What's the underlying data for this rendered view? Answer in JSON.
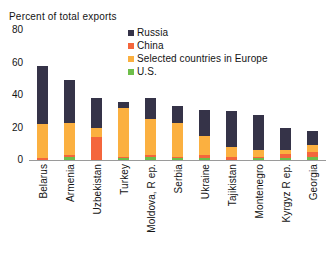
{
  "chart_data": {
    "type": "bar",
    "subtype": "stacked-vertical",
    "title": "Percent of total exports",
    "xlabel": "",
    "ylabel": "",
    "ylim": [
      0,
      80
    ],
    "yticks": [
      80,
      60,
      40,
      20,
      0
    ],
    "grid": false,
    "legend_position": "top-right",
    "stack_order_bottom_to_top": [
      "U.S.",
      "China",
      "Selected countries in Europe",
      "Russia"
    ],
    "categories": [
      "Belarus",
      "Armenia",
      "Uzbekistan",
      "Turkey",
      "Moldova, R ep.",
      "Serbia",
      "Ukraine",
      "Tajikistan",
      "Montenegro",
      "Kyrgyz R ep.",
      "Georgia"
    ],
    "series": [
      {
        "name": "U.S.",
        "color": "#6EBE4A",
        "values": [
          0,
          2,
          0,
          1,
          2,
          1,
          1,
          0,
          1,
          1,
          2
        ]
      },
      {
        "name": "China",
        "color": "#F4663C",
        "values": [
          1,
          1,
          14,
          1,
          1,
          1,
          2,
          2,
          1,
          3,
          3
        ]
      },
      {
        "name": "Selected countries in Europe",
        "color": "#FBB040",
        "values": [
          21,
          20,
          6,
          30,
          22,
          21,
          12,
          6,
          4,
          2,
          4
        ]
      },
      {
        "name": "Russia",
        "color": "#353348",
        "values": [
          36,
          26,
          18,
          4,
          13,
          10,
          16,
          22,
          22,
          14,
          9
        ]
      }
    ],
    "totals": [
      58,
      49,
      38,
      36,
      38,
      33,
      31,
      30,
      28,
      20,
      18
    ]
  },
  "legend": {
    "items": [
      {
        "label": "Russia",
        "color": "#353348"
      },
      {
        "label": "China",
        "color": "#F4663C"
      },
      {
        "label": "Selected countries in Europe",
        "color": "#FBB040"
      },
      {
        "label": "U.S.",
        "color": "#6EBE4A"
      }
    ]
  }
}
